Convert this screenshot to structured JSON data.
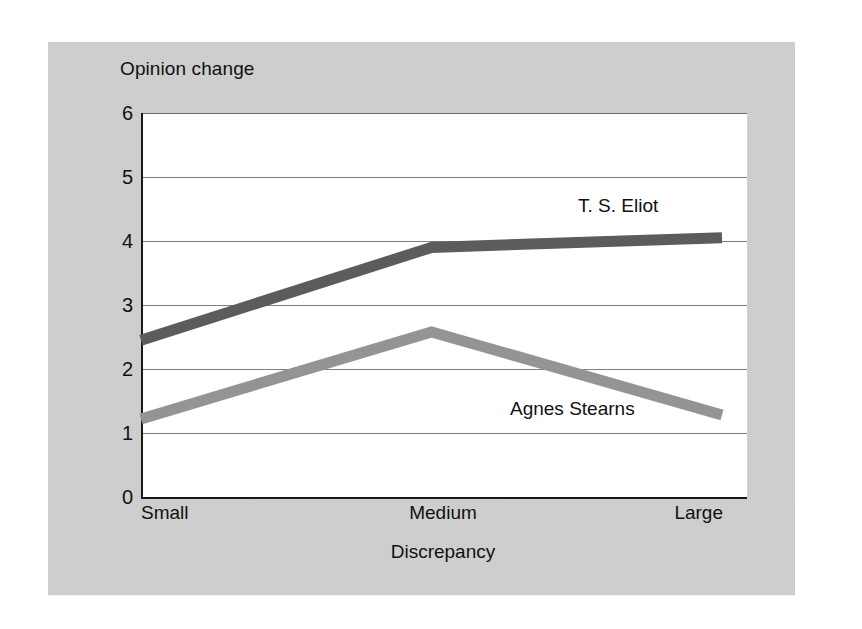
{
  "figure": {
    "background_color": "#cfcfcf",
    "plot_background_color": "#ffffff",
    "axis_color": "#1a1a1a",
    "gridline_color": "#7e7e7e"
  },
  "chart_data": {
    "type": "line",
    "title": "",
    "xlabel": "Discrepancy",
    "ylabel": "Opinion change",
    "categories": [
      "Small",
      "Medium",
      "Large"
    ],
    "ylim": [
      0,
      6
    ],
    "yticks": [
      "0",
      "1",
      "2",
      "3",
      "4",
      "5",
      "6"
    ],
    "ytick_values": [
      0,
      1,
      2,
      3,
      4,
      5,
      6
    ],
    "grid": true,
    "grid_axis": "y",
    "legend_position": "inline-annotation",
    "series": [
      {
        "name": "T. S. Eliot",
        "values": [
          2.45,
          3.9,
          4.05
        ],
        "color": "#5c5c5c",
        "label_x": 578,
        "label_y": 195
      },
      {
        "name": "Agnes Stearns",
        "values": [
          1.22,
          2.58,
          1.28
        ],
        "color": "#949494",
        "label_x": 510,
        "label_y": 398
      }
    ]
  }
}
